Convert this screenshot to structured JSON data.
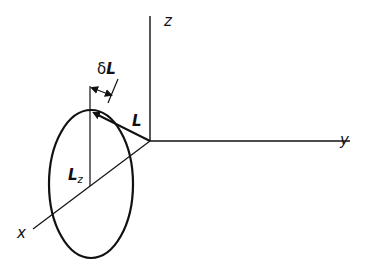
{
  "diagram": {
    "type": "vector-precession",
    "labels": {
      "z_axis": "z",
      "y_axis": "y",
      "x_axis": "x",
      "vector": "L",
      "projection_main": "L",
      "projection_sub": "z",
      "delta_prefix": "δ",
      "delta_main": "L"
    },
    "colors": {
      "stroke": "#111111",
      "background": "#ffffff"
    }
  }
}
